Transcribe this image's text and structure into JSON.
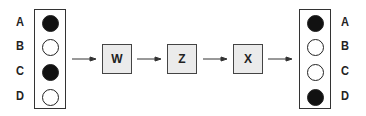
{
  "diagram": {
    "input": {
      "labels": [
        "A",
        "B",
        "C",
        "D"
      ],
      "states": [
        true,
        false,
        true,
        false
      ]
    },
    "nodes": [
      {
        "label": "W"
      },
      {
        "label": "Z"
      },
      {
        "label": "X"
      }
    ],
    "output": {
      "labels": [
        "A",
        "B",
        "C",
        "D"
      ],
      "states": [
        true,
        false,
        false,
        true
      ]
    },
    "colors": {
      "filled": "#111111",
      "empty": "#ffffff",
      "node_fill": "#ebebeb",
      "stroke": "#333333"
    }
  }
}
